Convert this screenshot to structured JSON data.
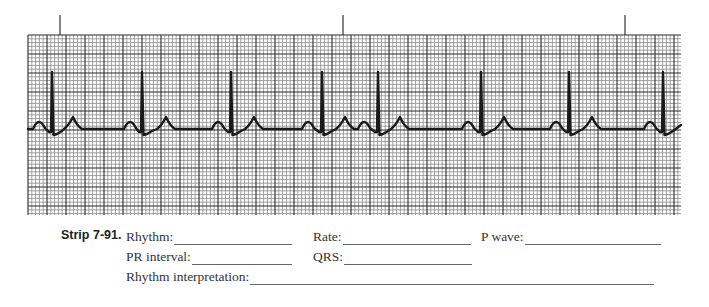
{
  "chart_data": {
    "type": "line",
    "strip_id": "Strip 7-91.",
    "xlabel": "",
    "ylabel": "",
    "grid": true,
    "grid_geometry": {
      "left": 28,
      "top": 35,
      "right": 681,
      "bottom": 215,
      "small_box_px": 3.8,
      "large_box_px": 19
    },
    "time_markers_x": [
      60,
      343,
      625
    ],
    "r_peaks_x": [
      52,
      142,
      231,
      322,
      378,
      481,
      569,
      663
    ],
    "baseline_y": 129,
    "r_peak_y": 72,
    "beats": [
      {
        "r": 52,
        "t": 73,
        "p_next": 130
      },
      {
        "r": 142,
        "t": 166,
        "p_next": 218
      },
      {
        "r": 231,
        "t": 254,
        "p_next": 308
      },
      {
        "r": 322,
        "t": 345,
        "p_next": 364
      },
      {
        "r": 378,
        "t": 400,
        "p_next": 468
      },
      {
        "r": 481,
        "t": 504,
        "p_next": 556
      },
      {
        "r": 569,
        "t": 592,
        "p_next": 650
      },
      {
        "r": 663,
        "t": null,
        "p_next": null
      }
    ],
    "leading_p_x": 39,
    "colors": {
      "trace": "#1a1a1a",
      "grid_minor": "#8a8a8a",
      "grid_major": "#2a2a2a",
      "paper": "#ffffff"
    }
  },
  "worksheet": {
    "strip_label": "Strip 7-91.",
    "fields": {
      "rhythm": {
        "label": "Rhythm:",
        "value": ""
      },
      "rate": {
        "label": "Rate:",
        "value": ""
      },
      "p_wave": {
        "label": "P wave:",
        "value": ""
      },
      "pr_interval": {
        "label": "PR interval:",
        "value": ""
      },
      "qrs": {
        "label": "QRS:",
        "value": ""
      },
      "rhythm_interpretation": {
        "label": "Rhythm interpretation:",
        "value": ""
      }
    }
  }
}
